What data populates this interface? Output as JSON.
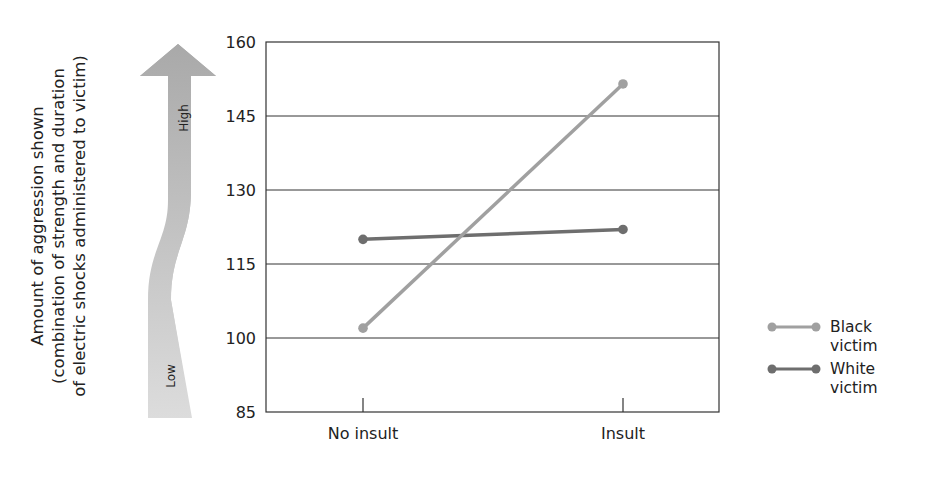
{
  "chart_data": {
    "type": "line",
    "title": "",
    "xlabel": "",
    "ylabel": [
      "Amount of aggression shown",
      "(combination of strength and duration",
      "of electric shocks administered to victim)"
    ],
    "categories": [
      "No insult",
      "Insult"
    ],
    "series": [
      {
        "name": "Black victim",
        "color": "#a0a0a0",
        "values": [
          102,
          151.5
        ]
      },
      {
        "name": "White victim",
        "color": "#6e6e6e",
        "values": [
          120,
          122
        ]
      }
    ],
    "ylim": [
      85,
      160
    ],
    "yticks": [
      "160",
      "145",
      "130",
      "115",
      "100",
      "85"
    ],
    "grid": true,
    "legend_position": "right",
    "annotation_arrow": {
      "high_label": "High",
      "low_label": "Low"
    }
  },
  "legend": {
    "black": {
      "line1": "Black",
      "line2": "victim"
    },
    "white": {
      "line1": "White",
      "line2": "victim"
    }
  }
}
